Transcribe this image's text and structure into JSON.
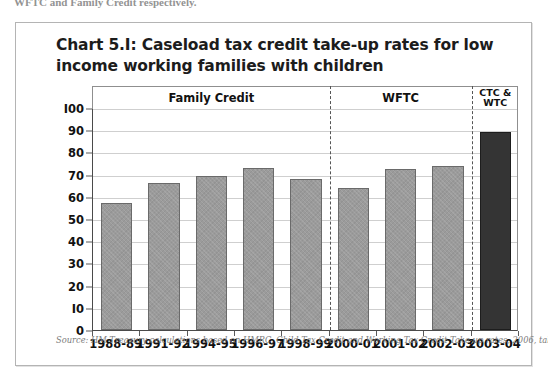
{
  "page": {
    "top_cut_text": "WFTC and Family Credit respectively."
  },
  "chart_title": "Chart 5.I: Caseload tax credit take-up rates for low income working families with children",
  "source_note": "Source: HM Treasury calculations based on HMRC, Child Tax Credit and Working Tax Credit Take-up rates, 2006, table 2.",
  "colors": {
    "bar_light": "#9b9b9b",
    "bar_dark": "#343434",
    "frame": "#b4b4b4",
    "gridline": "#cfcfcf",
    "axis": "#4a4a4a",
    "text": "#111111",
    "source_text": "#7d7d7d"
  },
  "chart_data": {
    "type": "bar",
    "title": "Chart 5.I: Caseload tax credit take-up rates for low income working families with children",
    "xlabel": "",
    "ylabel": "",
    "ylim": [
      0,
      100
    ],
    "yticks": [
      0,
      10,
      20,
      30,
      40,
      50,
      60,
      70,
      80,
      90,
      100
    ],
    "ytick_labels": [
      "0",
      "I0",
      "20",
      "30",
      "40",
      "50",
      "60",
      "70",
      "80",
      "90",
      "I00"
    ],
    "grid": true,
    "legend": "none",
    "categories": [
      "1988-89",
      "1991-92",
      "1994-95",
      "1996-97",
      "1998-99",
      "2000-01",
      "2001-02",
      "2002-03",
      "2003-04"
    ],
    "values": [
      57,
      66,
      69.5,
      73,
      68,
      64,
      72.5,
      74,
      89
    ],
    "bar_styles": [
      "light",
      "light",
      "light",
      "light",
      "light",
      "light",
      "light",
      "light",
      "dark"
    ],
    "period_bands": [
      {
        "label": "Family Credit",
        "start_index": 0,
        "end_index": 4
      },
      {
        "label": "WFTC",
        "start_index": 5,
        "end_index": 7
      },
      {
        "label": "CTC &\nWTC",
        "label_line1": "CTC &",
        "label_line2": "WTC",
        "start_index": 8,
        "end_index": 8
      }
    ],
    "dividers_after_index": [
      4,
      7
    ],
    "source": "Source: HM Treasury calculations based on HMRC, Child Tax Credit and Working Tax Credit Take-up rates, 2006, table 2."
  }
}
